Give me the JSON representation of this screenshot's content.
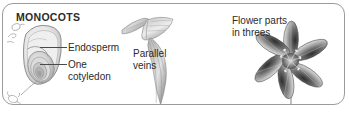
{
  "panel": {
    "title": "MONOCOTS",
    "border_color": "#9b9b9b",
    "background_color": "#ffffff",
    "text_color": "#2b2b2b"
  },
  "labels": {
    "endosperm": "Endosperm",
    "one_cotyledon_line1": "One",
    "one_cotyledon_line2": "cotyledon",
    "parallel_line1": "Parallel",
    "parallel_line2": "veins",
    "flower_line1": "Flower parts",
    "flower_line2": "in threes"
  },
  "illustrations": {
    "seed": "monocot-seed-cross-section",
    "sprouts": "germinating-seed-sketches",
    "leaf": "parallel-veined-leaf",
    "flower": "six-petal-lily-flower"
  },
  "palette": {
    "outline": "#6e6e6e",
    "seed_light": "#f2f2f2",
    "seed_mid": "#cfcfcf",
    "seed_dark": "#a8a8a8",
    "leaf_light": "#dcdcdc",
    "leaf_dark": "#8a8a8a",
    "flower_light": "#cccccc",
    "flower_dark": "#3a3a3a"
  }
}
